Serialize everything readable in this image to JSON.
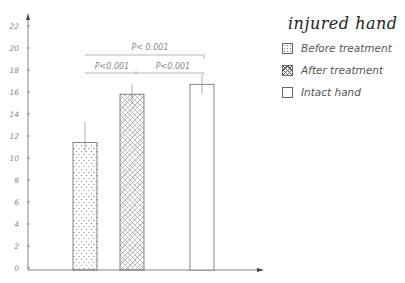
{
  "chart_data": {
    "type": "bar",
    "title": "injured hand",
    "xlabel": "",
    "ylabel": "",
    "ylim": [
      0,
      23
    ],
    "yticks": [
      0,
      2,
      4,
      6,
      8,
      10,
      12,
      14,
      16,
      18,
      20,
      22
    ],
    "ytick_labels": [
      "0",
      "2",
      "4",
      "6",
      "8",
      "10",
      "12",
      "14",
      "16",
      "18",
      "20",
      "22"
    ],
    "grid": false,
    "legend_position": "upper right",
    "categories": [
      "Before treatment",
      "After treatment",
      "Intact hand"
    ],
    "values": [
      11.4,
      15.8,
      16.7
    ],
    "error_upper": [
      13.3,
      16.7,
      17.6
    ],
    "patterns": [
      "dots",
      "crosshatch",
      "empty"
    ],
    "annotations": [
      {
        "text": "P< 0.001",
        "between": [
          "Before treatment",
          "Intact hand"
        ]
      },
      {
        "text": "P<0.001",
        "between": [
          "Before treatment",
          "After treatment"
        ]
      },
      {
        "text": "P<0.001",
        "between": [
          "After treatment",
          "Intact hand"
        ]
      }
    ]
  },
  "legend": {
    "title": "injured hand",
    "items": [
      {
        "label": "Before treatment",
        "pattern": "dots"
      },
      {
        "label": "After treatment",
        "pattern": "crosshatch"
      },
      {
        "label": "Intact hand",
        "pattern": "empty"
      }
    ]
  },
  "colors": {
    "line": "#666666",
    "text": "#888888",
    "background": "#ffffff"
  }
}
